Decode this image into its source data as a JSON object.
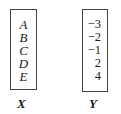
{
  "sets": [
    {
      "name": "X",
      "elements": [
        "A",
        "B",
        "C",
        "D",
        "E"
      ]
    },
    {
      "name": "Y",
      "elements": [
        "−3",
        "−2",
        "−1",
        "2",
        "4"
      ]
    }
  ]
}
